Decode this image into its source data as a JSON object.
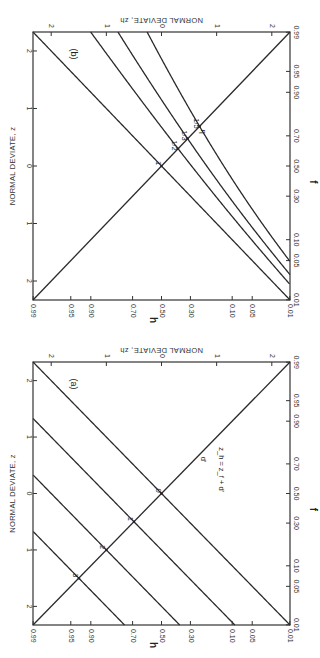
{
  "chart_data": [
    {
      "type": "line",
      "panel_label": "(a)",
      "title": "",
      "xlabel": "f",
      "ylabel": "h",
      "x2label": "NORMAL DEVIATE, z_f",
      "y2label": "NORMAL DEVIATE, z_h",
      "x_prob_ticks": [
        "0.01",
        "0.05",
        "0.10",
        "0.30",
        "0.50",
        "0.70",
        "0.90",
        "0.95",
        "0.99"
      ],
      "y_prob_ticks": [
        "0.01",
        "0.05",
        "0.10",
        "0.30",
        "0.50",
        "0.70",
        "0.90",
        "0.95",
        "0.99"
      ],
      "x_z_ticks": [
        "2",
        "1",
        "0",
        "1",
        "2"
      ],
      "y_z_ticks": [
        "2",
        "1",
        "0",
        "1",
        "2"
      ],
      "z_range": [
        -2.33,
        2.33
      ],
      "formula": "z_h = z_f + d'",
      "annotation_param": "d'",
      "series": [
        {
          "name": "0",
          "dprime": 0
        },
        {
          "name": "1",
          "dprime": 1
        },
        {
          "name": "2",
          "dprime": 2
        },
        {
          "name": "3",
          "dprime": 3
        }
      ],
      "negative_diagonal": true
    },
    {
      "type": "line",
      "panel_label": "(b)",
      "title": "",
      "xlabel": "f",
      "ylabel": "h",
      "x2label": "NORMAL DEVIATE, z_f",
      "y2label": "NORMAL DEVIATE, z_h",
      "x_prob_ticks": [
        "0.01",
        "0.05",
        "0.10",
        "0.30",
        "0.50",
        "0.70",
        "0.90",
        "0.95",
        "0.99"
      ],
      "y_prob_ticks": [
        "0.01",
        "0.05",
        "0.10",
        "0.30",
        "0.50",
        "0.70",
        "0.90",
        "0.95",
        "0.99"
      ],
      "x_z_ticks": [
        "2",
        "1",
        "0",
        "1",
        "2"
      ],
      "y_z_ticks": [
        "2",
        "1",
        "0",
        "1",
        "2"
      ],
      "z_range": [
        -2.33,
        2.33
      ],
      "annotation_param": "η",
      "series": [
        {
          "name": "1",
          "eta": 1
        },
        {
          "name": "1/2",
          "eta": 0.5
        },
        {
          "name": "1/3",
          "eta": 0.3333
        },
        {
          "name": "1/5",
          "eta": 0.2
        }
      ],
      "negative_diagonal": true
    }
  ]
}
